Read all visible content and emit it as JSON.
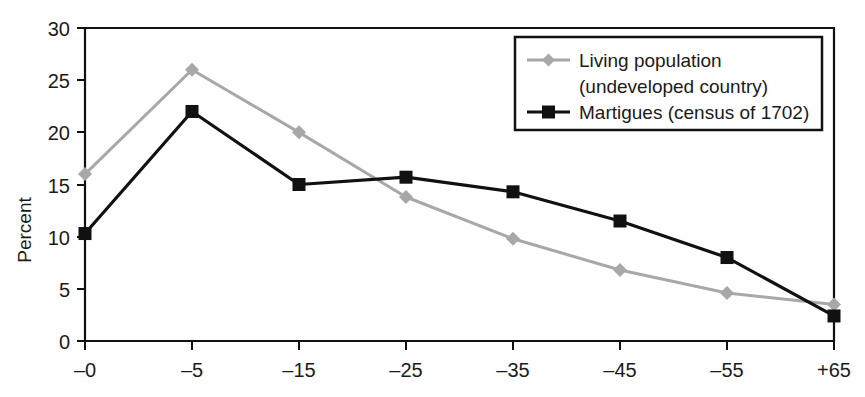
{
  "chart_data": {
    "type": "line",
    "title": "",
    "xlabel": "",
    "ylabel": "Percent",
    "categories": [
      "–0",
      "–5",
      "–15",
      "–25",
      "–35",
      "–45",
      "–55",
      "+65"
    ],
    "ylim": [
      0,
      30
    ],
    "yticks": [
      "0",
      "5",
      "10",
      "15",
      "20",
      "25",
      "30"
    ],
    "ytick_values": [
      0,
      5,
      10,
      15,
      20,
      25,
      30
    ],
    "grid": false,
    "legend_position": "top-right",
    "series": [
      {
        "name": "Living population (undeveloped country)",
        "legend_line_1": "Living population",
        "legend_line_2": "(undeveloped country)",
        "color": "#a8a8a8",
        "marker": "diamond",
        "values": [
          16.0,
          26.0,
          20.0,
          13.8,
          9.8,
          6.8,
          4.6,
          3.5
        ]
      },
      {
        "name": "Martigues (census of 1702)",
        "legend_line_1": "Martigues (census of 1702)",
        "legend_line_2": "",
        "color": "#111111",
        "marker": "square",
        "values": [
          10.3,
          22.0,
          15.0,
          15.7,
          14.3,
          11.5,
          8.0,
          2.4
        ]
      }
    ]
  },
  "axis": {
    "y_label": "Percent",
    "y_tick_30": "30",
    "y_tick_25": "25",
    "y_tick_20": "20",
    "y_tick_15": "15",
    "y_tick_10": "10",
    "y_tick_5": "5",
    "y_tick_0": "0",
    "x_tick_0": "–0",
    "x_tick_1": "–5",
    "x_tick_2": "–15",
    "x_tick_3": "–25",
    "x_tick_4": "–35",
    "x_tick_5": "–45",
    "x_tick_6": "–55",
    "x_tick_7": "+65"
  },
  "legend": {
    "entry_living_line1": "Living population",
    "entry_living_line2": "(undeveloped country)",
    "entry_martigues": "Martigues (census of 1702)"
  }
}
